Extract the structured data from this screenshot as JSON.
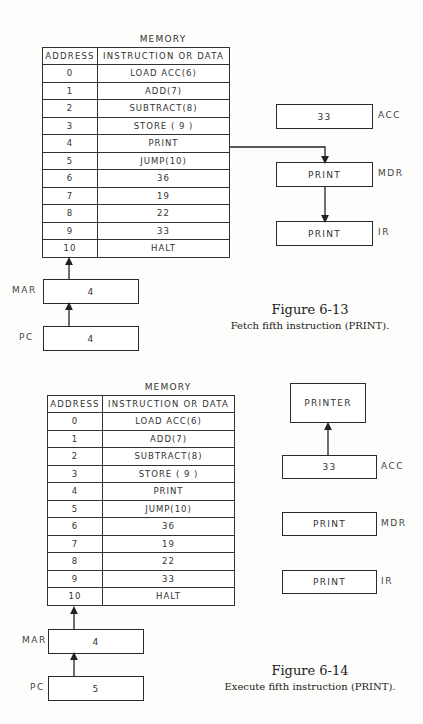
{
  "figures": [
    {
      "memory_title": "MEMORY",
      "headers": [
        "ADDRESS",
        "INSTRUCTION OR DATA"
      ],
      "rows": [
        [
          "0",
          "LOAD ACC(6)"
        ],
        [
          "1",
          "ADD(7)"
        ],
        [
          "2",
          "SUBTRACT(8)"
        ],
        [
          "3",
          "STORE ( 9 )"
        ],
        [
          "4",
          "PRINT"
        ],
        [
          "5",
          "JUMP(10)"
        ],
        [
          "6",
          "36"
        ],
        [
          "7",
          "19"
        ],
        [
          "8",
          "22"
        ],
        [
          "9",
          "33"
        ],
        [
          "10",
          "HALT"
        ]
      ],
      "registers": {
        "acc": {
          "label": "ACC",
          "value": "33"
        },
        "mdr": {
          "label": "MDR",
          "value": "PRINT"
        },
        "ir": {
          "label": "IR",
          "value": "PRINT"
        },
        "mar": {
          "label": "MAR",
          "value": "4"
        },
        "pc": {
          "label": "PC",
          "value": "4"
        }
      },
      "caption_title": "Figure 6-13",
      "caption_text": "Fetch fifth instruction (PRINT)."
    },
    {
      "memory_title": "MEMORY",
      "headers": [
        "ADDRESS",
        "INSTRUCTION OR DATA"
      ],
      "rows": [
        [
          "0",
          "LOAD ACC(6)"
        ],
        [
          "1",
          "ADD(7)"
        ],
        [
          "2",
          "SUBTRACT(8)"
        ],
        [
          "3",
          "STORE ( 9 )"
        ],
        [
          "4",
          "PRINT"
        ],
        [
          "5",
          "JUMP(10)"
        ],
        [
          "6",
          "36"
        ],
        [
          "7",
          "19"
        ],
        [
          "8",
          "22"
        ],
        [
          "9",
          "33"
        ],
        [
          "10",
          "HALT"
        ]
      ],
      "printer": {
        "label": "PRINTER"
      },
      "registers": {
        "acc": {
          "label": "ACC",
          "value": "33"
        },
        "mdr": {
          "label": "MDR",
          "value": "PRINT"
        },
        "ir": {
          "label": "IR",
          "value": "PRINT"
        },
        "mar": {
          "label": "MAR",
          "value": "4"
        },
        "pc": {
          "label": "PC",
          "value": "5"
        }
      },
      "caption_title": "Figure 6-14",
      "caption_text": "Execute fifth instruction (PRINT)."
    }
  ]
}
